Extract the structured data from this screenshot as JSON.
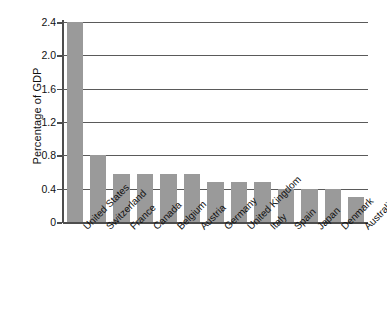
{
  "chart_data": {
    "type": "bar",
    "title": "",
    "xlabel": "",
    "ylabel": "Percentage of GDP",
    "ylim": [
      0,
      2.4
    ],
    "yticks": [
      "0",
      "0.4",
      "0.8",
      "1.2",
      "1.6",
      "2.0",
      "2.4"
    ],
    "ytick_values": [
      0,
      0.4,
      0.8,
      1.2,
      1.6,
      2.0,
      2.4
    ],
    "grid": true,
    "legend": null,
    "bar_color": "#9a9a9a",
    "categories": [
      "United States",
      "Switzerland",
      "France",
      "Canada",
      "Belgium",
      "Austria",
      "Germany",
      "United Kingdom",
      "Italy",
      "Spain",
      "Japan",
      "Denmark",
      "Australia"
    ],
    "values": [
      2.4,
      0.8,
      0.58,
      0.58,
      0.58,
      0.58,
      0.48,
      0.48,
      0.48,
      0.4,
      0.4,
      0.4,
      0.3
    ]
  }
}
